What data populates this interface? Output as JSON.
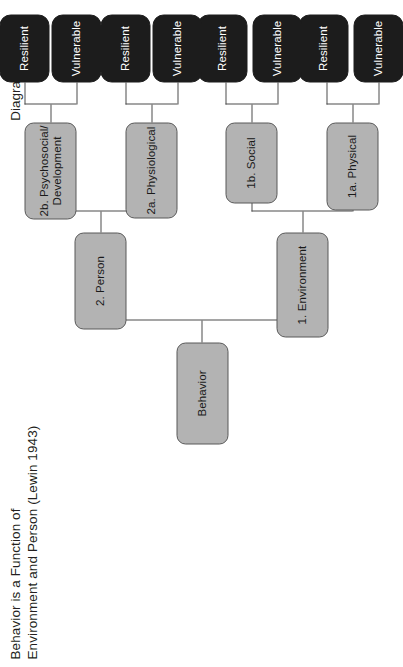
{
  "page": {
    "title_lines": "Behavior is a Function of\nEnvironment and Person (Lewin 1943)",
    "caption": "Diagram 1",
    "rotation_degrees": -90,
    "background_color": "#ffffff"
  },
  "palette": {
    "node_gray_fill": "#b3b3b3",
    "node_gray_border": "#595959",
    "node_black_fill": "#1c1c1c",
    "node_black_text": "#ffffff",
    "connector": "#4d4d4d",
    "text": "#231f20"
  },
  "tree": {
    "root": {
      "label": "Behavior"
    },
    "level2": [
      {
        "label": "1. Environment"
      },
      {
        "label": "2. Person"
      }
    ],
    "level3": [
      {
        "label": "1a. Physical"
      },
      {
        "label": "1b. Social"
      },
      {
        "label": "2a. Physiological"
      },
      {
        "label": "2b. Psychosocial/\nDevelopment"
      }
    ],
    "leaves": [
      {
        "label": "Vulnerable"
      },
      {
        "label": "Resilient"
      },
      {
        "label": "Vulnerable"
      },
      {
        "label": "Resilient"
      },
      {
        "label": "Vulnerable"
      },
      {
        "label": "Resilient"
      },
      {
        "label": "Vulnerable"
      },
      {
        "label": "Resilient"
      }
    ]
  }
}
